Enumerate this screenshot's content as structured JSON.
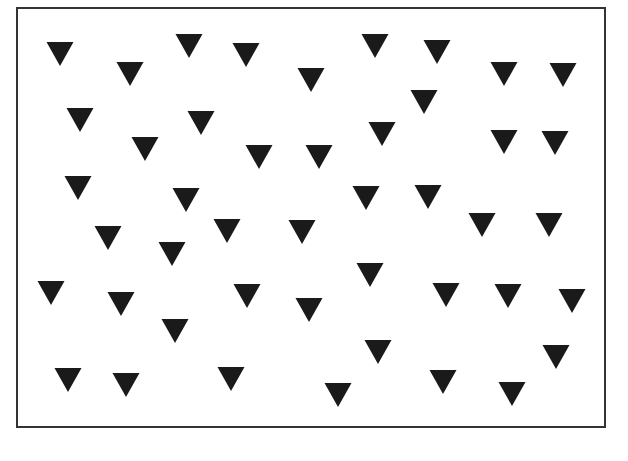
{
  "figure": {
    "frame": {
      "left": 16,
      "top": 7,
      "right": 606,
      "bottom": 428,
      "border_color": "#333333"
    },
    "shape": {
      "type": "triangle-down",
      "width": 27,
      "height": 24,
      "color": "#1a1a1a"
    },
    "count": 46,
    "triangles": [
      [
        60,
        42
      ],
      [
        130,
        62
      ],
      [
        189,
        34
      ],
      [
        246,
        43
      ],
      [
        311,
        68
      ],
      [
        375,
        34
      ],
      [
        437,
        40
      ],
      [
        504,
        62
      ],
      [
        563,
        63
      ],
      [
        80,
        108
      ],
      [
        201,
        111
      ],
      [
        424,
        90
      ],
      [
        145,
        137
      ],
      [
        259,
        145
      ],
      [
        319,
        145
      ],
      [
        382,
        122
      ],
      [
        504,
        130
      ],
      [
        555,
        131
      ],
      [
        78,
        176
      ],
      [
        186,
        188
      ],
      [
        366,
        186
      ],
      [
        428,
        185
      ],
      [
        108,
        226
      ],
      [
        172,
        242
      ],
      [
        227,
        219
      ],
      [
        302,
        220
      ],
      [
        482,
        213
      ],
      [
        549,
        213
      ],
      [
        51,
        281
      ],
      [
        121,
        292
      ],
      [
        247,
        284
      ],
      [
        309,
        298
      ],
      [
        370,
        263
      ],
      [
        446,
        283
      ],
      [
        508,
        284
      ],
      [
        572,
        289
      ],
      [
        175,
        319
      ],
      [
        378,
        340
      ],
      [
        556,
        345
      ],
      [
        68,
        368
      ],
      [
        126,
        373
      ],
      [
        231,
        367
      ],
      [
        338,
        383
      ],
      [
        443,
        370
      ],
      [
        512,
        382
      ]
    ]
  }
}
